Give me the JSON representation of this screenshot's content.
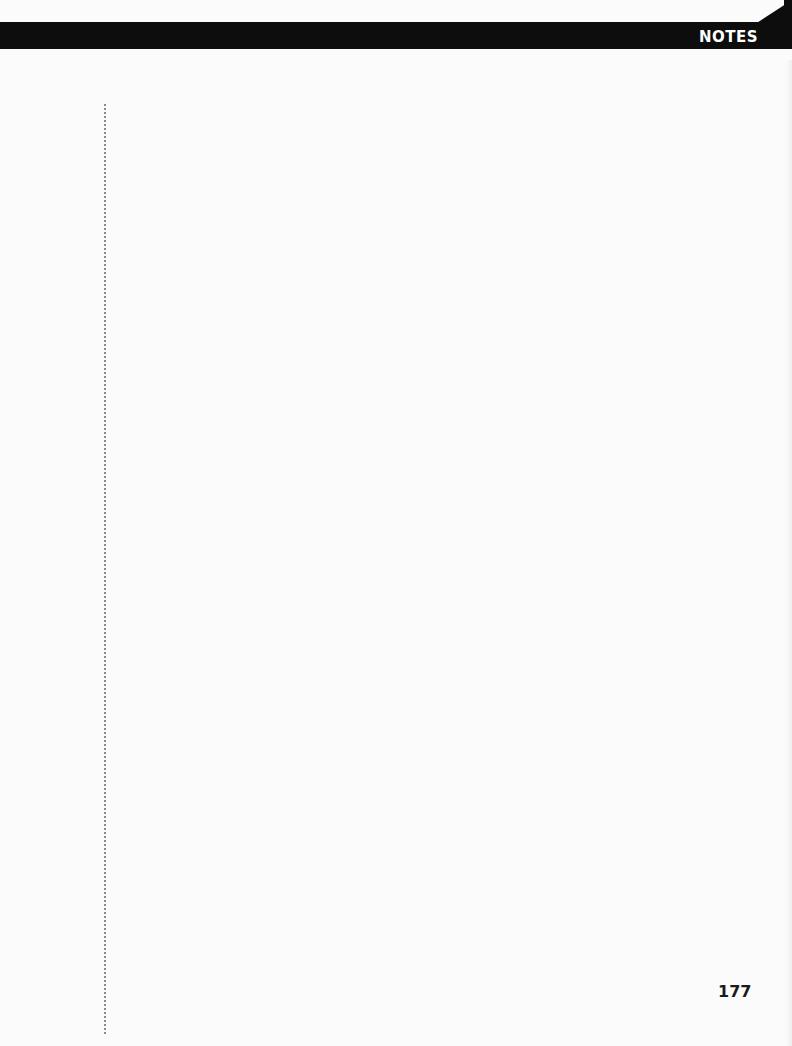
{
  "header": {
    "title": "NOTES",
    "bar_color": "#0d0d0d",
    "title_color": "#ffffff"
  },
  "notes": {
    "content": ""
  },
  "footer": {
    "page_number": "177"
  }
}
